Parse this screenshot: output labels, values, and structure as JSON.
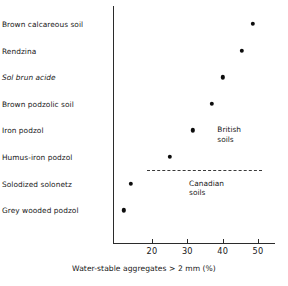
{
  "chart_data": {
    "type": "scatter",
    "title": "",
    "subtitle": "",
    "xlabel": "Water-stable aggregates > 2 mm (%)",
    "ylabel": "",
    "orientation": "horizontal",
    "grid": false,
    "legend": "none",
    "xlim": [
      10,
      53
    ],
    "xticks": [
      20,
      30,
      40,
      50
    ],
    "xtick_labels": [
      "20",
      "30",
      "40",
      "50"
    ],
    "categories": [
      "Brown calcareous soil",
      "Rendzina",
      "Sol brun acide",
      "Brown podzolic soil",
      "Iron podzol",
      "Humus-iron podzol",
      "Solodized solonetz",
      "Grey wooded podzol"
    ],
    "category_styles": [
      "normal",
      "normal",
      "italic",
      "normal",
      "normal",
      "normal",
      "normal",
      "normal"
    ],
    "values": [
      48.5,
      45.5,
      40.0,
      37.0,
      31.5,
      25.0,
      14.0,
      12.0
    ],
    "points": [
      {
        "category": "Brown calcareous soil",
        "value": 48.5
      },
      {
        "category": "Rendzina",
        "value": 45.5
      },
      {
        "category": "Sol brun acide",
        "value": 40.0
      },
      {
        "category": "Brown podzolic soil",
        "value": 37.0
      },
      {
        "category": "Iron podzol",
        "value": 31.5
      },
      {
        "category": "Humus-iron podzol",
        "value": 25.0
      },
      {
        "category": "Solodized solonetz",
        "value": 14.0
      },
      {
        "category": "Grey wooded podzol",
        "value": 12.0
      }
    ],
    "annotations": [
      {
        "name": "british-soils",
        "lines": [
          "British",
          "soils"
        ],
        "x": 38.5,
        "category_index": 4
      },
      {
        "name": "canadian-soils",
        "lines": [
          "Canadian",
          "soils"
        ],
        "x": 30.5,
        "category_index": 6
      }
    ],
    "separator": {
      "name": "canadian-british-divider",
      "style": "dashed",
      "between_categories": [
        "Humus-iron podzol",
        "Solodized solonetz"
      ],
      "x_start": 18.5,
      "x_end": 51.0
    },
    "marker": {
      "shape": "circle",
      "color": "#0d0d0d",
      "size": 4.4
    }
  },
  "colors": {
    "axis": "#2b2b2b",
    "text": "#171717",
    "marker": "#0d0d0d",
    "background": "#ffffff"
  }
}
